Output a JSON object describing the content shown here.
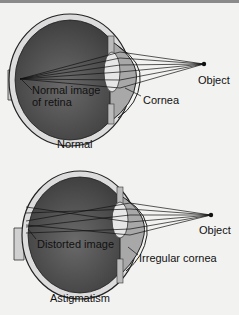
{
  "diagrams": [
    {
      "id": "normal",
      "caption": "Normal",
      "labels": {
        "object": "Object",
        "retina": "Normal image\nof retina",
        "retina_line1": "Normal image",
        "retina_line2": "of retina",
        "cornea": "Cornea"
      }
    },
    {
      "id": "astigmatism",
      "caption": "Astigmatism",
      "labels": {
        "object": "Object",
        "retina": "Distorted image",
        "cornea": "Irregular cornea"
      }
    }
  ],
  "colors": {
    "background": "#f2f2f0",
    "eye_interior": "#555555",
    "sclera": "#d8d8d8",
    "lens": "#e0e0e0",
    "rays": "#222222"
  }
}
